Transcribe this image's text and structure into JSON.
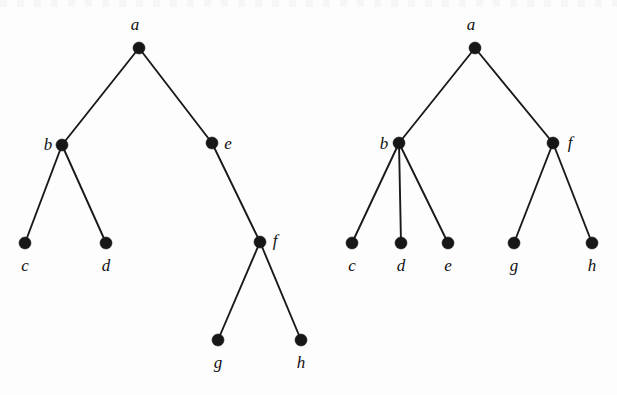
{
  "figure": {
    "background_color": "#fdfdfd",
    "node_color": "#171717",
    "edge_color": "#1a1a1a",
    "label_color": "#111111",
    "node_radius": 6,
    "width": 617,
    "height": 395
  },
  "trees": [
    {
      "name": "left-tree",
      "nodes": [
        {
          "id": "a",
          "label": "a",
          "x": 139,
          "y": 48,
          "label_x": 135,
          "label_y": 30,
          "label_anchor": "middle"
        },
        {
          "id": "b",
          "label": "b",
          "x": 62,
          "y": 145,
          "label_x": 48,
          "label_y": 150,
          "label_anchor": "middle"
        },
        {
          "id": "e",
          "label": "e",
          "x": 212,
          "y": 143,
          "label_x": 228,
          "label_y": 149,
          "label_anchor": "middle"
        },
        {
          "id": "c",
          "label": "c",
          "x": 25,
          "y": 243,
          "label_x": 25,
          "label_y": 271,
          "label_anchor": "middle"
        },
        {
          "id": "d",
          "label": "d",
          "x": 106,
          "y": 243,
          "label_x": 106,
          "label_y": 271,
          "label_anchor": "middle"
        },
        {
          "id": "f",
          "label": "f",
          "x": 260,
          "y": 242,
          "label_x": 275,
          "label_y": 246,
          "label_anchor": "middle"
        },
        {
          "id": "g",
          "label": "g",
          "x": 218,
          "y": 340,
          "label_x": 218,
          "label_y": 368,
          "label_anchor": "middle"
        },
        {
          "id": "h",
          "label": "h",
          "x": 301,
          "y": 340,
          "label_x": 301,
          "label_y": 368,
          "label_anchor": "middle"
        }
      ],
      "edges": [
        {
          "from": "a",
          "to": "b"
        },
        {
          "from": "a",
          "to": "e"
        },
        {
          "from": "b",
          "to": "c"
        },
        {
          "from": "b",
          "to": "d"
        },
        {
          "from": "e",
          "to": "f"
        },
        {
          "from": "f",
          "to": "g"
        },
        {
          "from": "f",
          "to": "h"
        }
      ]
    },
    {
      "name": "right-tree",
      "nodes": [
        {
          "id": "a",
          "label": "a",
          "x": 475,
          "y": 48,
          "label_x": 471,
          "label_y": 30,
          "label_anchor": "middle"
        },
        {
          "id": "b",
          "label": "b",
          "x": 399,
          "y": 143,
          "label_x": 384,
          "label_y": 149,
          "label_anchor": "middle"
        },
        {
          "id": "f",
          "label": "f",
          "x": 553,
          "y": 143,
          "label_x": 570,
          "label_y": 148,
          "label_anchor": "middle"
        },
        {
          "id": "c",
          "label": "c",
          "x": 352,
          "y": 243,
          "label_x": 352,
          "label_y": 271,
          "label_anchor": "middle"
        },
        {
          "id": "d",
          "label": "d",
          "x": 401,
          "y": 243,
          "label_x": 401,
          "label_y": 271,
          "label_anchor": "middle"
        },
        {
          "id": "e",
          "label": "e",
          "x": 448,
          "y": 243,
          "label_x": 448,
          "label_y": 271,
          "label_anchor": "middle"
        },
        {
          "id": "g",
          "label": "g",
          "x": 514,
          "y": 243,
          "label_x": 514,
          "label_y": 271,
          "label_anchor": "middle"
        },
        {
          "id": "h",
          "label": "h",
          "x": 592,
          "y": 243,
          "label_x": 592,
          "label_y": 271,
          "label_anchor": "middle"
        }
      ],
      "edges": [
        {
          "from": "a",
          "to": "b"
        },
        {
          "from": "a",
          "to": "f"
        },
        {
          "from": "b",
          "to": "c"
        },
        {
          "from": "b",
          "to": "d"
        },
        {
          "from": "b",
          "to": "e"
        },
        {
          "from": "f",
          "to": "g"
        },
        {
          "from": "f",
          "to": "h"
        }
      ]
    }
  ]
}
